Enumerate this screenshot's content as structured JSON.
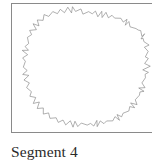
{
  "figure": {
    "caption": "Segment 4",
    "frame": {
      "border_color": "#8a8a8a",
      "background_color": "#ffffff",
      "left": 11,
      "top": 3,
      "width": 145,
      "height": 130
    },
    "caption_color": "#2a2a2a"
  },
  "chart_data": {
    "type": "line",
    "title": "Segment 4",
    "subtitle": "",
    "xlabel": "",
    "ylabel": "",
    "grid": false,
    "legend": null,
    "axis_visible": false,
    "stroke_color": "#7a7a7a",
    "stroke_width": 0.6,
    "fill": "none",
    "closed": true,
    "iteration_label": "Segment 4",
    "xlim": [
      0,
      145
    ],
    "ylim": [
      0,
      130
    ],
    "base_polygon_points": [
      [
        72,
        8
      ],
      [
        100,
        14
      ],
      [
        122,
        32
      ],
      [
        132,
        58
      ],
      [
        128,
        86
      ],
      [
        108,
        108
      ],
      [
        80,
        120
      ],
      [
        52,
        118
      ],
      [
        30,
        100
      ],
      [
        18,
        72
      ],
      [
        20,
        42
      ],
      [
        40,
        18
      ]
    ],
    "jag_amplitude": 2.4,
    "jag_period_px": 4.0,
    "points": [
      [
        72,
        8
      ],
      [
        76,
        10
      ],
      [
        80,
        7
      ],
      [
        84,
        11
      ],
      [
        88,
        9
      ],
      [
        92,
        12
      ],
      [
        96,
        10
      ],
      [
        100,
        14
      ],
      [
        104,
        12
      ],
      [
        108,
        17
      ],
      [
        112,
        15
      ],
      [
        116,
        21
      ],
      [
        119,
        19
      ],
      [
        122,
        26
      ],
      [
        125,
        24
      ],
      [
        128,
        31
      ],
      [
        130,
        29
      ],
      [
        132,
        37
      ],
      [
        134,
        35
      ],
      [
        135,
        44
      ],
      [
        133,
        46
      ],
      [
        136,
        53
      ],
      [
        134,
        55
      ],
      [
        136,
        63
      ],
      [
        133,
        65
      ],
      [
        135,
        72
      ],
      [
        131,
        74
      ],
      [
        133,
        81
      ],
      [
        129,
        83
      ],
      [
        130,
        90
      ],
      [
        125,
        91
      ],
      [
        126,
        98
      ],
      [
        121,
        99
      ],
      [
        120,
        105
      ],
      [
        115,
        105
      ],
      [
        113,
        111
      ],
      [
        108,
        110
      ],
      [
        105,
        116
      ],
      [
        100,
        114
      ],
      [
        96,
        119
      ],
      [
        92,
        117
      ],
      [
        87,
        121
      ],
      [
        83,
        118
      ],
      [
        78,
        122
      ],
      [
        74,
        119
      ],
      [
        69,
        122
      ],
      [
        65,
        119
      ],
      [
        60,
        121
      ],
      [
        56,
        118
      ],
      [
        51,
        119
      ],
      [
        47,
        116
      ],
      [
        43,
        116
      ],
      [
        39,
        112
      ],
      [
        35,
        111
      ],
      [
        32,
        107
      ],
      [
        28,
        105
      ],
      [
        26,
        100
      ],
      [
        22,
        97
      ],
      [
        21,
        92
      ],
      [
        17,
        88
      ],
      [
        17,
        83
      ],
      [
        14,
        78
      ],
      [
        15,
        73
      ],
      [
        12,
        68
      ],
      [
        14,
        63
      ],
      [
        11,
        58
      ],
      [
        14,
        53
      ],
      [
        12,
        48
      ],
      [
        16,
        43
      ],
      [
        14,
        39
      ],
      [
        18,
        34
      ],
      [
        17,
        30
      ],
      [
        22,
        26
      ],
      [
        22,
        22
      ],
      [
        27,
        19
      ],
      [
        28,
        15
      ],
      [
        33,
        13
      ],
      [
        36,
        10
      ],
      [
        41,
        10
      ],
      [
        45,
        7
      ],
      [
        49,
        8
      ],
      [
        54,
        5
      ],
      [
        58,
        7
      ],
      [
        63,
        4
      ],
      [
        67,
        7
      ],
      [
        72,
        8
      ]
    ]
  }
}
